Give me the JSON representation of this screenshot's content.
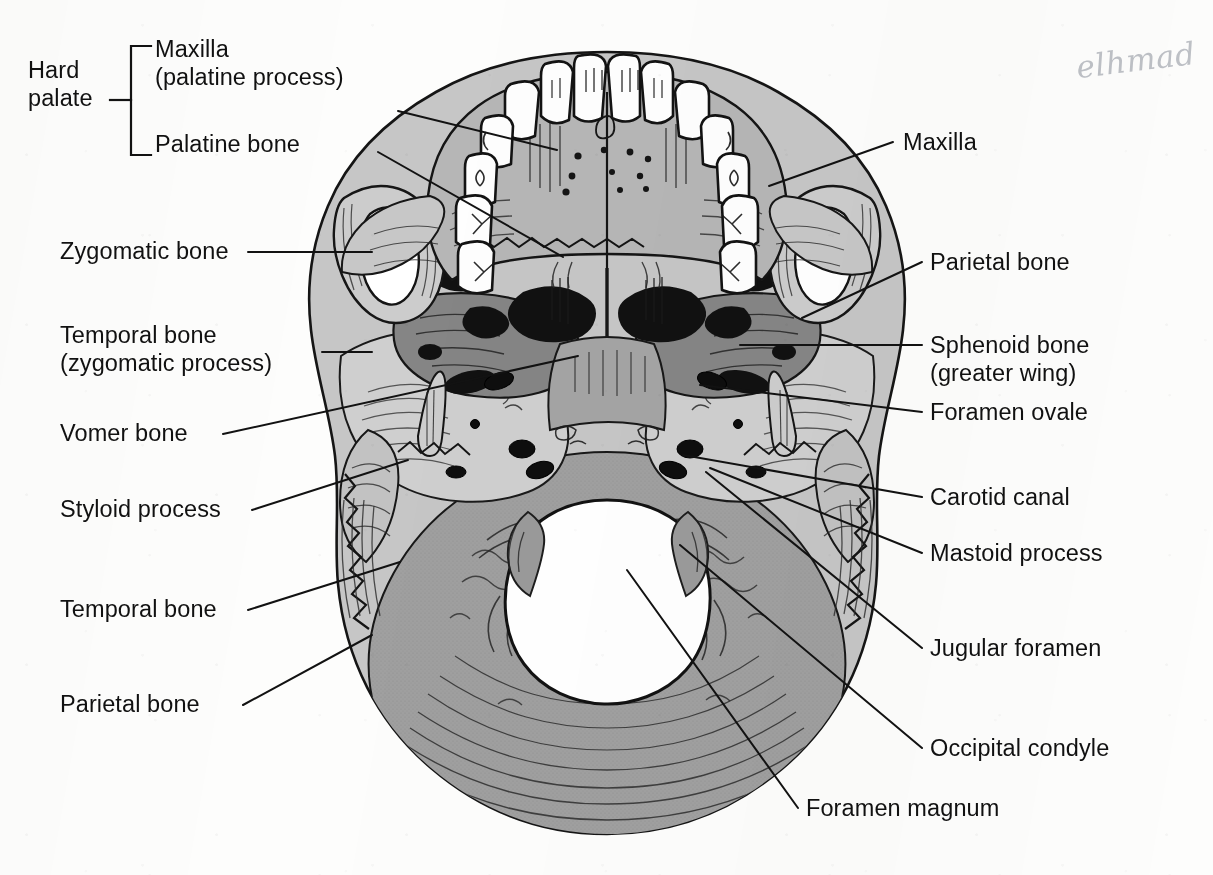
{
  "page": {
    "background_color": "#fdfdfc",
    "width": 1213,
    "height": 875
  },
  "annotation": {
    "handwriting": "elhmad",
    "color": "#b9bcc2"
  },
  "bracket_group": {
    "name": "Hard palate",
    "label_line_1": "Hard",
    "label_line_2": "palate",
    "members": [
      "Maxilla\n(palatine process)",
      "Palatine bone"
    ]
  },
  "labels_left": [
    {
      "id": "maxilla-palatine-process",
      "text": "Maxilla\n(palatine process)",
      "x": 155,
      "y": 36
    },
    {
      "id": "palatine-bone",
      "text": "Palatine bone",
      "x": 155,
      "y": 131
    },
    {
      "id": "zygomatic-bone",
      "text": "Zygomatic bone",
      "x": 60,
      "y": 243
    },
    {
      "id": "temporal-bone-zygomatic-process",
      "text": "Temporal bone\n(zygomatic process)",
      "x": 60,
      "y": 326
    },
    {
      "id": "vomer-bone",
      "text": "Vomer bone",
      "x": 60,
      "y": 420
    },
    {
      "id": "styloid-process",
      "text": "Styloid process",
      "x": 60,
      "y": 506
    },
    {
      "id": "temporal-bone",
      "text": "Temporal bone",
      "x": 60,
      "y": 602
    },
    {
      "id": "parietal-bone-left",
      "text": "Parietal bone",
      "x": 60,
      "y": 697
    }
  ],
  "labels_right": [
    {
      "id": "maxilla",
      "text": "Maxilla",
      "x": 903,
      "y": 135
    },
    {
      "id": "parietal-bone-right",
      "text": "Parietal bone",
      "x": 930,
      "y": 254
    },
    {
      "id": "sphenoid-bone-greater-wing",
      "text": "Sphenoid bone\n(greater wing)",
      "x": 930,
      "y": 336
    },
    {
      "id": "foramen-ovale",
      "text": "Foramen ovale",
      "x": 930,
      "y": 404
    },
    {
      "id": "carotid-canal",
      "text": "Carotid canal",
      "x": 930,
      "y": 489
    },
    {
      "id": "mastoid-process",
      "text": "Mastoid process",
      "x": 930,
      "y": 545
    },
    {
      "id": "jugular-foramen",
      "text": "Jugular foramen",
      "x": 930,
      "y": 640
    },
    {
      "id": "occipital-condyle",
      "text": "Occipital condyle",
      "x": 930,
      "y": 740
    },
    {
      "id": "foramen-magnum",
      "text": "Foramen magnum",
      "x": 806,
      "y": 800
    }
  ],
  "leader_lines": [
    {
      "id": "leader-maxilla-palatine-process",
      "from": [
        398,
        111
      ],
      "to": [
        557,
        150
      ]
    },
    {
      "id": "leader-palatine-bone",
      "from": [
        378,
        152
      ],
      "to": [
        563,
        257
      ]
    },
    {
      "id": "leader-zygomatic-bone",
      "from": [
        248,
        252
      ],
      "to": [
        372,
        252
      ]
    },
    {
      "id": "leader-temporal-zygomatic-proc",
      "from": [
        322,
        352
      ],
      "to": [
        372,
        352
      ]
    },
    {
      "id": "leader-vomer-bone",
      "from": [
        223,
        434
      ],
      "to": [
        578,
        356
      ]
    },
    {
      "id": "leader-styloid-process",
      "from": [
        252,
        510
      ],
      "to": [
        408,
        460
      ]
    },
    {
      "id": "leader-temporal-bone",
      "from": [
        248,
        610
      ],
      "to": [
        400,
        562
      ]
    },
    {
      "id": "leader-parietal-bone-left",
      "from": [
        243,
        705
      ],
      "to": [
        372,
        635
      ]
    },
    {
      "id": "leader-maxilla",
      "from": [
        769,
        186
      ],
      "to": [
        893,
        142
      ]
    },
    {
      "id": "leader-parietal-bone-right",
      "from": [
        802,
        318
      ],
      "to": [
        922,
        262
      ]
    },
    {
      "id": "leader-sphenoid-greater-wing",
      "from": [
        740,
        345
      ],
      "to": [
        922,
        345
      ]
    },
    {
      "id": "leader-foramen-ovale",
      "from": [
        700,
        385
      ],
      "to": [
        922,
        412
      ]
    },
    {
      "id": "leader-carotid-canal",
      "from": [
        683,
        455
      ],
      "to": [
        922,
        497
      ]
    },
    {
      "id": "leader-mastoid-process",
      "from": [
        710,
        468
      ],
      "to": [
        922,
        553
      ]
    },
    {
      "id": "leader-jugular-foramen",
      "from": [
        706,
        472
      ],
      "to": [
        922,
        648
      ]
    },
    {
      "id": "leader-occipital-condyle",
      "from": [
        680,
        545
      ],
      "to": [
        922,
        748
      ]
    },
    {
      "id": "leader-foramen-magnum",
      "from": [
        627,
        570
      ],
      "to": [
        798,
        808
      ]
    }
  ],
  "art": {
    "palette": {
      "outline": "#151515",
      "bone_light": "#c9c9c9",
      "bone_mid": "#a8a8a8",
      "bone_dark": "#8a8a8a",
      "bone_darker": "#7b7b7b",
      "tooth_white": "#fefefe",
      "cavity_black": "#101010",
      "foramen_white": "#ffffff"
    },
    "regions": [
      {
        "name": "teeth-upper-arch",
        "tone": "tooth_white"
      },
      {
        "name": "hard-palate",
        "tone": "bone_mid"
      },
      {
        "name": "zygomatic-arch-left",
        "tone": "bone_light"
      },
      {
        "name": "zygomatic-arch-right",
        "tone": "bone_light"
      },
      {
        "name": "sphenoid-greater-wing",
        "tone": "bone_darker"
      },
      {
        "name": "temporal-bone-petrous",
        "tone": "bone_light"
      },
      {
        "name": "occipital-bone",
        "tone": "bone_dark"
      },
      {
        "name": "foramen-magnum",
        "tone": "foramen_white"
      },
      {
        "name": "nasal-choanae",
        "tone": "cavity_black"
      }
    ]
  }
}
